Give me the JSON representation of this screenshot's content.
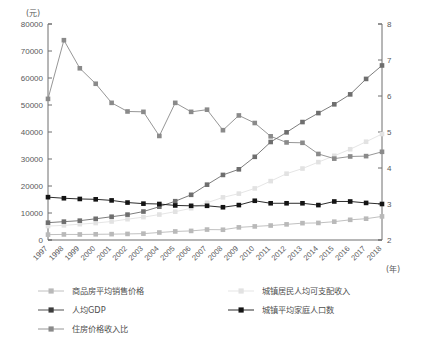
{
  "chart_data": {
    "type": "line",
    "title": "",
    "xlabel": "(年)",
    "ylabel_left": "(元)",
    "ylabel_right": "",
    "grid": false,
    "legend_position": "bottom",
    "categories": [
      "1997",
      "1998",
      "1999",
      "2000",
      "2001",
      "2002",
      "2003",
      "2004",
      "2005",
      "2006",
      "2007",
      "2008",
      "2009",
      "2010",
      "2011",
      "2012",
      "2013",
      "2014",
      "2015",
      "2016",
      "2017",
      "2018"
    ],
    "ylim_left": [
      0,
      80000
    ],
    "yticks_left": [
      "0",
      "10000",
      "20000",
      "30000",
      "40000",
      "50000",
      "60000",
      "70000",
      "80000"
    ],
    "ylim_right": [
      2,
      8
    ],
    "yticks_right": [
      "2",
      "3",
      "4",
      "5",
      "6",
      "7",
      "8"
    ],
    "series": [
      {
        "name": "商品房平均销售价格",
        "axis": "left",
        "color": "#b9b9b9",
        "values": [
          1997,
          2063,
          2053,
          2112,
          2170,
          2250,
          2359,
          2778,
          3168,
          3367,
          3864,
          3800,
          4681,
          5032,
          5357,
          5791,
          6237,
          6324,
          6793,
          7476,
          7892,
          8737
        ]
      },
      {
        "name": "城镇居民人均可支配收入",
        "axis": "left",
        "color": "#e2e2e2",
        "values": [
          5160,
          5425,
          5854,
          6280,
          6860,
          7703,
          8472,
          9422,
          10493,
          11759,
          13786,
          15781,
          17175,
          19109,
          21810,
          24565,
          26467,
          28844,
          31195,
          33616,
          36396,
          39251
        ]
      },
      {
        "name": "人均GDP",
        "axis": "left",
        "color": "#6e6e6e",
        "values": [
          6420,
          6796,
          7159,
          7858,
          8622,
          9398,
          10542,
          12336,
          14368,
          16738,
          20494,
          24100,
          26180,
          30808,
          36302,
          39874,
          43684,
          47005,
          50251,
          53935,
          59660,
          64644
        ]
      },
      {
        "name": "城镇平均家庭人口数",
        "axis": "right",
        "color": "#141414",
        "values": [
          3.19,
          3.16,
          3.14,
          3.13,
          3.1,
          3.04,
          3.01,
          3.0,
          2.96,
          2.95,
          2.95,
          2.91,
          2.97,
          3.09,
          3.02,
          3.02,
          3.02,
          2.97,
          3.07,
          3.07,
          3.03,
          3.0
        ]
      },
      {
        "name": "住房价格收入比",
        "axis": "right",
        "color": "#8a8a8a",
        "values": [
          5.92,
          7.55,
          6.77,
          6.34,
          5.81,
          5.57,
          5.56,
          4.89,
          5.81,
          5.56,
          5.62,
          5.05,
          5.46,
          5.25,
          4.88,
          4.71,
          4.7,
          4.39,
          4.26,
          4.32,
          4.33,
          4.45
        ]
      }
    ]
  },
  "legend": {
    "items": [
      {
        "label": "商品房平均销售价格",
        "color": "#b9b9b9",
        "marker": "square"
      },
      {
        "label": "城镇居民人均可支配收入",
        "color": "#e2e2e2",
        "marker": "square"
      },
      {
        "label": "人均GDP",
        "color": "#3c3c3c",
        "marker": "square"
      },
      {
        "label": "城镇平均家庭人口数",
        "color": "#141414",
        "marker": "square"
      },
      {
        "label": "住房价格收入比",
        "color": "#8a8a8a",
        "marker": "square"
      }
    ]
  }
}
